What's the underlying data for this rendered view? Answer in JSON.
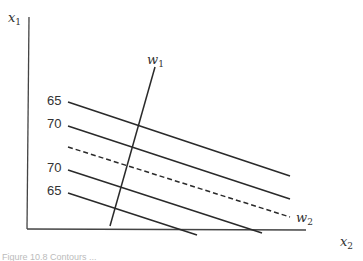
{
  "diagram": {
    "axes": {
      "y_label": "x",
      "y_label_sub": "1",
      "x_label": "x",
      "x_label_sub": "2"
    },
    "vectors": {
      "w1_label": "w",
      "w1_sub": "1",
      "w2_label": "w",
      "w2_sub": "2"
    },
    "contour_labels": [
      "65",
      "70",
      "70",
      "65"
    ],
    "lines": [
      {
        "name": "contour-65-upper",
        "x1": 68,
        "y1": 102,
        "x2": 290,
        "y2": 176,
        "style": "solid"
      },
      {
        "name": "contour-70-upper",
        "x1": 68,
        "y1": 126,
        "x2": 290,
        "y2": 199,
        "style": "solid"
      },
      {
        "name": "w2-dashed",
        "x1": 68,
        "y1": 147,
        "x2": 290,
        "y2": 217,
        "style": "dashed"
      },
      {
        "name": "contour-70-lower",
        "x1": 68,
        "y1": 170,
        "x2": 262,
        "y2": 233,
        "style": "solid"
      },
      {
        "name": "contour-65-lower",
        "x1": 68,
        "y1": 193,
        "x2": 197,
        "y2": 235,
        "style": "solid"
      },
      {
        "name": "w1-line",
        "x1": 155,
        "y1": 67,
        "x2": 110,
        "y2": 226,
        "style": "solid"
      }
    ],
    "caption": "Figure 10.8  Contours ..."
  }
}
